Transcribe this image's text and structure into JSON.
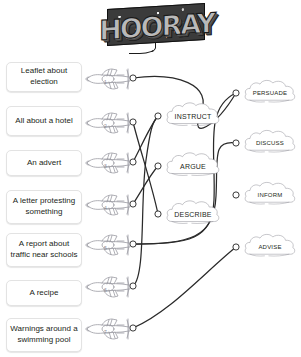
{
  "header": {
    "logo_text": "HOORAY",
    "logo_name": "hooray-logo"
  },
  "prompts": [
    {
      "id": 1,
      "label": "Leaflet about election",
      "y": 62
    },
    {
      "id": 2,
      "label": "All about a hotel",
      "y": 106
    },
    {
      "id": 3,
      "label": "An advert",
      "y": 150
    },
    {
      "id": 4,
      "label": "A letter protesting something",
      "y": 190
    },
    {
      "id": 5,
      "label": "A report about traffic near schools",
      "y": 233
    },
    {
      "id": 6,
      "label": "A recipe",
      "y": 280
    },
    {
      "id": 7,
      "label": "Warnings around a swimming pool",
      "y": 318
    }
  ],
  "planes": [
    {
      "id": 1,
      "number": "1",
      "x": 84,
      "y": 64,
      "node_x": 133,
      "node_y": 78
    },
    {
      "id": 2,
      "number": "2",
      "x": 84,
      "y": 108,
      "node_x": 133,
      "node_y": 122
    },
    {
      "id": 3,
      "number": "3",
      "x": 84,
      "y": 148,
      "node_x": 133,
      "node_y": 162
    },
    {
      "id": 4,
      "number": "4",
      "x": 84,
      "y": 190,
      "node_x": 133,
      "node_y": 204
    },
    {
      "id": 5,
      "number": "5",
      "x": 84,
      "y": 230,
      "node_x": 133,
      "node_y": 244
    },
    {
      "id": 6,
      "number": "6",
      "x": 84,
      "y": 272,
      "node_x": 133,
      "node_y": 286
    },
    {
      "id": 7,
      "number": "7",
      "x": 84,
      "y": 314,
      "node_x": 133,
      "node_y": 328
    }
  ],
  "clouds_middle": [
    {
      "id": "instruct",
      "label": "INSTRUCT",
      "x": 164,
      "y": 100,
      "w": 58,
      "h": 32,
      "node_x": 158,
      "node_y": 116
    },
    {
      "id": "argue",
      "label": "ARGUE",
      "x": 164,
      "y": 150,
      "w": 58,
      "h": 32,
      "node_x": 158,
      "node_y": 166
    },
    {
      "id": "describe",
      "label": "DESCRIBE",
      "x": 164,
      "y": 198,
      "w": 58,
      "h": 32,
      "node_x": 158,
      "node_y": 214
    }
  ],
  "clouds_right": [
    {
      "id": "persuade",
      "label": "PERSUADE",
      "x": 242,
      "y": 78,
      "w": 56,
      "h": 30,
      "node_x": 236,
      "node_y": 93
    },
    {
      "id": "discuss",
      "label": "DISCUSS",
      "x": 242,
      "y": 128,
      "w": 56,
      "h": 30,
      "node_x": 236,
      "node_y": 143
    },
    {
      "id": "inform",
      "label": "INFORM",
      "x": 242,
      "y": 180,
      "w": 56,
      "h": 30,
      "node_x": 236,
      "node_y": 195
    },
    {
      "id": "advise",
      "label": "ADVISE",
      "x": 242,
      "y": 232,
      "w": 56,
      "h": 30,
      "node_x": 236,
      "node_y": 247
    }
  ],
  "connections": [
    {
      "from": "plane-1",
      "to": "persuade",
      "path": "M133,78 C175,72 215,84 200,115 C190,140 215,128 236,93"
    },
    {
      "from": "plane-2",
      "to": "describe",
      "path": "M133,122 C140,150 152,185 158,214"
    },
    {
      "from": "plane-3",
      "to": "instruct",
      "path": "M133,162 C142,145 150,126 158,116"
    },
    {
      "from": "plane-4",
      "to": "argue",
      "path": "M133,204 C142,190 150,175 158,166"
    },
    {
      "from": "plane-5",
      "to": "inform",
      "path": "M133,244 C190,244 212,240 214,200 C216,150 204,108 236,93"
    },
    {
      "from": "plane-5b",
      "to": "discuss",
      "path": "M133,244 C190,244 214,238 216,196 C218,158 212,140 236,143"
    },
    {
      "from": "plane-6",
      "to": "instruct",
      "path": "M133,286 C146,276 140,200 146,160 C150,132 152,122 158,116"
    },
    {
      "from": "plane-7",
      "to": "advise",
      "path": "M133,328 C170,312 205,272 236,247"
    }
  ],
  "colors": {
    "wire": "#2a2a2a",
    "sketch": "#9a9aa2",
    "cloud_stroke": "#8e8e96",
    "card_border": "#e3e3e3",
    "text": "#231f20"
  }
}
